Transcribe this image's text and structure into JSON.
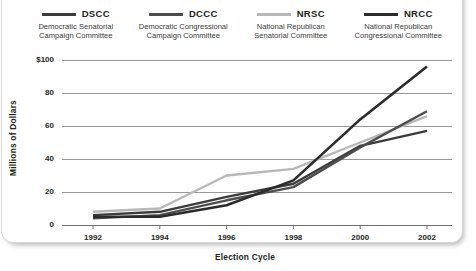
{
  "legend": {
    "items": [
      {
        "abbr": "DSCC",
        "full": "Democratic Senatorial\nCampaign Committee",
        "color": "#3b3b3b"
      },
      {
        "abbr": "DCCC",
        "full": "Democratic Congressional\nCampaign Committee",
        "color": "#4d4d4d"
      },
      {
        "abbr": "NRSC",
        "full": "National Republican\nSenatorial Committee",
        "color": "#b8b8b8"
      },
      {
        "abbr": "NRCC",
        "full": "National Republican\nCongressional Committee",
        "color": "#2b2b2b"
      }
    ]
  },
  "chart_data": {
    "type": "line",
    "title": "",
    "xlabel": "Election Cycle",
    "ylabel": "Millions of Dollars",
    "categories": [
      "1992",
      "1994",
      "1996",
      "1998",
      "2000",
      "2002"
    ],
    "x_tick_labels": [
      "1992",
      "1994",
      "1996",
      "1998",
      "2000",
      "2002"
    ],
    "y_tick_labels": [
      "0",
      "20",
      "40",
      "60",
      "80",
      "$100"
    ],
    "y_ticks": [
      0,
      20,
      40,
      60,
      80,
      100
    ],
    "ylim": [
      0,
      100
    ],
    "grid": "horizontal",
    "legend_position": "top",
    "series": [
      {
        "name": "DSCC",
        "label": "Democratic Senatorial Campaign Committee",
        "color": "#3b3b3b",
        "width": 2.4,
        "values": [
          6,
          8,
          17,
          25,
          48,
          57
        ]
      },
      {
        "name": "DCCC",
        "label": "Democratic Congressional Campaign Committee",
        "color": "#4d4d4d",
        "width": 2.4,
        "values": [
          4,
          6,
          15,
          23,
          47,
          69
        ]
      },
      {
        "name": "NRSC",
        "label": "National Republican Senatorial Committee",
        "color": "#b8b8b8",
        "width": 2.4,
        "values": [
          8,
          10,
          30,
          34,
          50,
          66
        ]
      },
      {
        "name": "NRCC",
        "label": "National Republican Congressional Committee",
        "color": "#2b2b2b",
        "width": 2.6,
        "values": [
          5,
          5,
          12,
          27,
          64,
          96
        ]
      }
    ]
  }
}
